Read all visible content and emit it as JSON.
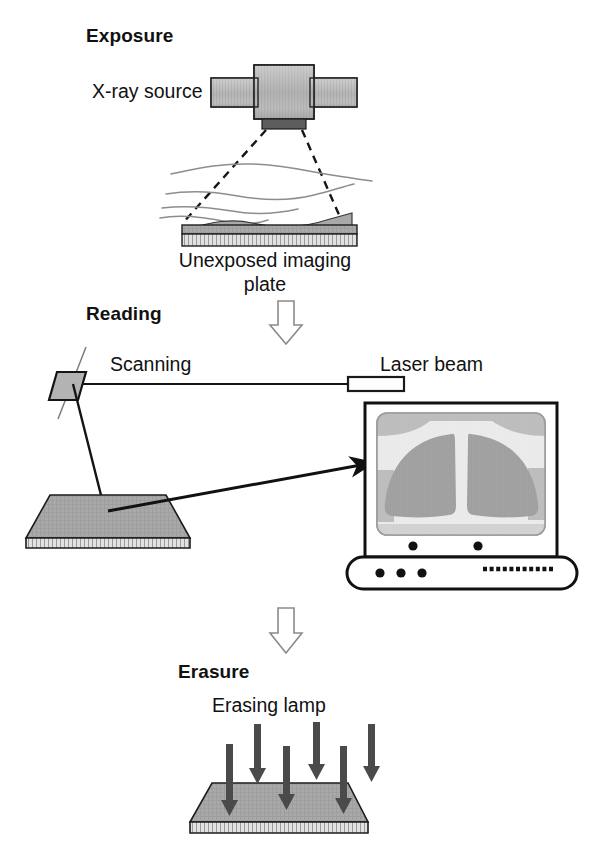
{
  "diagram": {
    "background_color": "#ffffff",
    "ink_color": "#111111",
    "sections": [
      {
        "id": "exposure",
        "heading": "Exposure",
        "heading_x": 86,
        "heading_y": 42,
        "labels": [
          {
            "name": "x-ray-source-label",
            "text": "X-ray source",
            "x": 92,
            "y": 92
          },
          {
            "name": "plate-label-line1",
            "text": "Unexposed imaging",
            "x": 265,
            "y": 245
          },
          {
            "name": "plate-label-line2",
            "text": "plate",
            "x": 265,
            "y": 269
          }
        ]
      },
      {
        "id": "reading",
        "heading": "Reading",
        "heading_x": 86,
        "heading_y": 315,
        "labels": [
          {
            "name": "scanning-label",
            "text": "Scanning",
            "x": 110,
            "y": 363
          },
          {
            "name": "laser-beam-label",
            "text": "Laser beam",
            "x": 380,
            "y": 363
          }
        ]
      },
      {
        "id": "erasure",
        "heading": "Erasure",
        "heading_x": 178,
        "heading_y": 672,
        "labels": [
          {
            "name": "erasing-lamp-label",
            "text": "Erasing lamp",
            "x": 285,
            "y": 706
          }
        ]
      }
    ],
    "colors": {
      "plate_top_gray": "#a8a8a8",
      "plate_edge_gray": "#d8d8d8",
      "tube_body_gray": "#b9b9b9",
      "tube_window_dark": "#5d5d5d",
      "screen_bg": "#e6e6e6",
      "lung_gray": "#8c8c8c",
      "soft_tissue_gray": "#b5b5b5",
      "arrow_dark": "#4a4a4a",
      "outline": "#111111",
      "body_contour": "#8d8d8d",
      "connector_outline": "#8a8a8a"
    },
    "counts": {
      "erasing_lamp_arrows": 6,
      "monitor_front_buttons": 3,
      "monitor_bezel_buttons": 2,
      "body_contour_lines": 4,
      "connector_arrows": 2
    },
    "elements": {
      "xray_tube": "x-ray tube with central housing and two cylindrical arms",
      "beam_style": "dashed diverging beam lines",
      "imaging_plate": "gray parallelogram slab with hatched white edge",
      "scanning_mirror": "small gray parallelogram mirror with rotation axis",
      "laser_source": "narrow outlined rectangle",
      "monitor": "CRT-style monitor displaying a chest radiograph"
    }
  }
}
